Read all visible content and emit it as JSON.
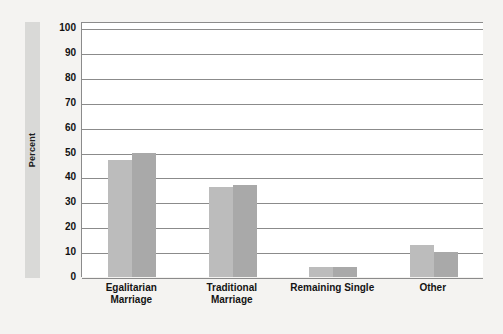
{
  "chart_data": {
    "type": "bar",
    "title": "",
    "xlabel": "",
    "ylabel": "Percent",
    "ylim": [
      0,
      100
    ],
    "ytick_step": 10,
    "yticks": [
      100,
      90,
      80,
      70,
      60,
      50,
      40,
      30,
      20,
      10,
      0
    ],
    "grid": true,
    "legend": "none",
    "categories": [
      "Egalitarian Marriage",
      "Traditional Marriage",
      "Remaining Single",
      "Other"
    ],
    "category_lines": [
      [
        "Egalitarian",
        "Marriage"
      ],
      [
        "Traditional",
        "Marriage"
      ],
      [
        "Remaining Single",
        ""
      ],
      [
        "Other",
        ""
      ]
    ],
    "series": [
      {
        "name": "Series 1",
        "color": "#bcbcbc",
        "values": [
          47,
          36,
          4,
          13
        ]
      },
      {
        "name": "Series 2",
        "color": "#a9a9a9",
        "values": [
          50,
          37,
          4,
          10
        ]
      }
    ]
  },
  "colors": {
    "background": "#f4f3f1",
    "plot_background": "#ffffff",
    "gridline": "#8b8b8b",
    "axis_band": "#d9d9d7",
    "series_a": "#bcbcbc",
    "series_b": "#a9a9a9",
    "text": "#111111"
  }
}
